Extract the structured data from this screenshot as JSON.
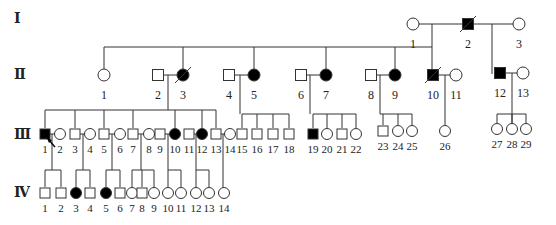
{
  "colors": {
    "line": "#333333",
    "affected": "#000000",
    "unaffected": "#ffffff"
  },
  "generations": [
    {
      "label": "Ⅰ",
      "y": 18
    },
    {
      "label": "Ⅱ",
      "y": 74
    },
    {
      "label": "Ⅲ",
      "y": 134
    },
    {
      "label": "Ⅳ",
      "y": 192
    }
  ],
  "individuals": [
    {
      "id": "I-1",
      "gen": 1,
      "num": "1",
      "sex": "F",
      "affected": false,
      "deceased": false,
      "x": 413,
      "y": 24
    },
    {
      "id": "I-2",
      "gen": 1,
      "num": "2",
      "sex": "M",
      "affected": true,
      "deceased": true,
      "x": 468,
      "y": 24
    },
    {
      "id": "I-3",
      "gen": 1,
      "num": "3",
      "sex": "F",
      "affected": false,
      "deceased": false,
      "x": 519,
      "y": 24
    },
    {
      "id": "II-1",
      "gen": 2,
      "num": "1",
      "sex": "F",
      "affected": false,
      "deceased": false,
      "x": 104,
      "y": 75
    },
    {
      "id": "II-2",
      "gen": 2,
      "num": "2",
      "sex": "M",
      "affected": false,
      "deceased": false,
      "x": 158,
      "y": 75
    },
    {
      "id": "II-3",
      "gen": 2,
      "num": "3",
      "sex": "F",
      "affected": true,
      "deceased": true,
      "x": 183,
      "y": 75
    },
    {
      "id": "II-4",
      "gen": 2,
      "num": "4",
      "sex": "M",
      "affected": false,
      "deceased": false,
      "x": 229,
      "y": 75
    },
    {
      "id": "II-5",
      "gen": 2,
      "num": "5",
      "sex": "F",
      "affected": true,
      "deceased": false,
      "x": 254,
      "y": 75
    },
    {
      "id": "II-6",
      "gen": 2,
      "num": "6",
      "sex": "M",
      "affected": false,
      "deceased": false,
      "x": 301,
      "y": 75
    },
    {
      "id": "II-7",
      "gen": 2,
      "num": "7",
      "sex": "F",
      "affected": true,
      "deceased": false,
      "x": 326,
      "y": 75
    },
    {
      "id": "II-8",
      "gen": 2,
      "num": "8",
      "sex": "M",
      "affected": false,
      "deceased": false,
      "x": 371,
      "y": 75
    },
    {
      "id": "II-9",
      "gen": 2,
      "num": "9",
      "sex": "F",
      "affected": true,
      "deceased": false,
      "x": 395,
      "y": 75
    },
    {
      "id": "II-10",
      "gen": 2,
      "num": "10",
      "sex": "M",
      "affected": true,
      "deceased": true,
      "x": 433,
      "y": 75
    },
    {
      "id": "II-11",
      "gen": 2,
      "num": "11",
      "sex": "F",
      "affected": false,
      "deceased": false,
      "x": 456,
      "y": 75
    },
    {
      "id": "II-12",
      "gen": 2,
      "num": "12",
      "sex": "M",
      "affected": true,
      "deceased": false,
      "x": 500,
      "y": 73
    },
    {
      "id": "II-13",
      "gen": 2,
      "num": "13",
      "sex": "F",
      "affected": false,
      "deceased": false,
      "x": 523,
      "y": 73
    },
    {
      "id": "III-1",
      "gen": 3,
      "num": "1",
      "sex": "M",
      "affected": true,
      "deceased": false,
      "proband": true,
      "x": 45,
      "y": 134
    },
    {
      "id": "III-2",
      "gen": 3,
      "num": "2",
      "sex": "F",
      "affected": false,
      "deceased": false,
      "x": 60,
      "y": 134
    },
    {
      "id": "III-3",
      "gen": 3,
      "num": "3",
      "sex": "M",
      "affected": false,
      "deceased": false,
      "x": 75,
      "y": 134
    },
    {
      "id": "III-4",
      "gen": 3,
      "num": "4",
      "sex": "F",
      "affected": false,
      "deceased": false,
      "x": 90,
      "y": 134
    },
    {
      "id": "III-5",
      "gen": 3,
      "num": "5",
      "sex": "M",
      "affected": false,
      "deceased": false,
      "x": 104,
      "y": 134
    },
    {
      "id": "III-6",
      "gen": 3,
      "num": "6",
      "sex": "F",
      "affected": false,
      "deceased": false,
      "x": 120,
      "y": 134
    },
    {
      "id": "III-7",
      "gen": 3,
      "num": "7",
      "sex": "M",
      "affected": false,
      "deceased": false,
      "x": 133,
      "y": 134
    },
    {
      "id": "III-8",
      "gen": 3,
      "num": "8",
      "sex": "F",
      "affected": false,
      "deceased": false,
      "x": 149,
      "y": 134
    },
    {
      "id": "III-9",
      "gen": 3,
      "num": "9",
      "sex": "M",
      "affected": false,
      "deceased": false,
      "x": 160,
      "y": 134
    },
    {
      "id": "III-10",
      "gen": 3,
      "num": "10",
      "sex": "F",
      "affected": true,
      "deceased": false,
      "x": 175,
      "y": 134
    },
    {
      "id": "III-11",
      "gen": 3,
      "num": "11",
      "sex": "M",
      "affected": false,
      "deceased": false,
      "x": 189,
      "y": 134
    },
    {
      "id": "III-12",
      "gen": 3,
      "num": "12",
      "sex": "F",
      "affected": true,
      "deceased": false,
      "x": 202,
      "y": 134
    },
    {
      "id": "III-13",
      "gen": 3,
      "num": "13",
      "sex": "M",
      "affected": false,
      "deceased": false,
      "x": 216,
      "y": 134
    },
    {
      "id": "III-14",
      "gen": 3,
      "num": "14",
      "sex": "F",
      "affected": false,
      "deceased": false,
      "x": 230,
      "y": 134
    },
    {
      "id": "III-15",
      "gen": 3,
      "num": "15",
      "sex": "M",
      "affected": false,
      "deceased": false,
      "x": 242,
      "y": 134
    },
    {
      "id": "III-16",
      "gen": 3,
      "num": "16",
      "sex": "M",
      "affected": false,
      "deceased": false,
      "x": 257,
      "y": 134
    },
    {
      "id": "III-17",
      "gen": 3,
      "num": "17",
      "sex": "M",
      "affected": false,
      "deceased": false,
      "x": 273,
      "y": 134
    },
    {
      "id": "III-18",
      "gen": 3,
      "num": "18",
      "sex": "M",
      "affected": false,
      "deceased": false,
      "x": 289,
      "y": 134
    },
    {
      "id": "III-19",
      "gen": 3,
      "num": "19",
      "sex": "M",
      "affected": true,
      "deceased": false,
      "x": 313,
      "y": 134
    },
    {
      "id": "III-20",
      "gen": 3,
      "num": "20",
      "sex": "F",
      "affected": false,
      "deceased": false,
      "x": 327,
      "y": 134
    },
    {
      "id": "III-21",
      "gen": 3,
      "num": "21",
      "sex": "M",
      "affected": false,
      "deceased": false,
      "x": 342,
      "y": 134
    },
    {
      "id": "III-22",
      "gen": 3,
      "num": "22",
      "sex": "F",
      "affected": false,
      "deceased": false,
      "x": 356,
      "y": 134
    },
    {
      "id": "III-23",
      "gen": 3,
      "num": "23",
      "sex": "M",
      "affected": false,
      "deceased": false,
      "x": 383,
      "y": 131
    },
    {
      "id": "III-24",
      "gen": 3,
      "num": "24",
      "sex": "F",
      "affected": false,
      "deceased": false,
      "x": 398,
      "y": 131
    },
    {
      "id": "III-25",
      "gen": 3,
      "num": "25",
      "sex": "F",
      "affected": false,
      "deceased": false,
      "x": 412,
      "y": 131
    },
    {
      "id": "III-26",
      "gen": 3,
      "num": "26",
      "sex": "F",
      "affected": false,
      "deceased": false,
      "x": 445,
      "y": 131
    },
    {
      "id": "III-27",
      "gen": 3,
      "num": "27",
      "sex": "F",
      "affected": false,
      "deceased": false,
      "x": 497,
      "y": 129
    },
    {
      "id": "III-28",
      "gen": 3,
      "num": "28",
      "sex": "F",
      "affected": false,
      "deceased": false,
      "x": 512,
      "y": 129
    },
    {
      "id": "III-29",
      "gen": 3,
      "num": "29",
      "sex": "F",
      "affected": false,
      "deceased": false,
      "x": 526,
      "y": 129
    },
    {
      "id": "IV-1",
      "gen": 4,
      "num": "1",
      "sex": "M",
      "affected": false,
      "deceased": false,
      "x": 45,
      "y": 193
    },
    {
      "id": "IV-2",
      "gen": 4,
      "num": "2",
      "sex": "M",
      "affected": false,
      "deceased": false,
      "x": 61,
      "y": 193
    },
    {
      "id": "IV-3",
      "gen": 4,
      "num": "3",
      "sex": "F",
      "affected": true,
      "deceased": false,
      "x": 76,
      "y": 193
    },
    {
      "id": "IV-4",
      "gen": 4,
      "num": "4",
      "sex": "M",
      "affected": false,
      "deceased": false,
      "x": 90,
      "y": 193
    },
    {
      "id": "IV-5",
      "gen": 4,
      "num": "5",
      "sex": "F",
      "affected": true,
      "deceased": false,
      "x": 106,
      "y": 193
    },
    {
      "id": "IV-6",
      "gen": 4,
      "num": "6",
      "sex": "M",
      "affected": false,
      "deceased": false,
      "x": 120,
      "y": 193
    },
    {
      "id": "IV-7",
      "gen": 4,
      "num": "7",
      "sex": "F",
      "affected": false,
      "deceased": false,
      "x": 132,
      "y": 193
    },
    {
      "id": "IV-8",
      "gen": 4,
      "num": "8",
      "sex": "M",
      "affected": false,
      "deceased": false,
      "x": 142,
      "y": 193
    },
    {
      "id": "IV-9",
      "gen": 4,
      "num": "9",
      "sex": "F",
      "affected": false,
      "deceased": false,
      "x": 154,
      "y": 193
    },
    {
      "id": "IV-10",
      "gen": 4,
      "num": "10",
      "sex": "F",
      "affected": false,
      "deceased": false,
      "x": 168,
      "y": 193
    },
    {
      "id": "IV-11",
      "gen": 4,
      "num": "11",
      "sex": "F",
      "affected": false,
      "deceased": false,
      "x": 181,
      "y": 193
    },
    {
      "id": "IV-12",
      "gen": 4,
      "num": "12",
      "sex": "F",
      "affected": false,
      "deceased": false,
      "x": 196,
      "y": 193
    },
    {
      "id": "IV-13",
      "gen": 4,
      "num": "13",
      "sex": "F",
      "affected": false,
      "deceased": false,
      "x": 209,
      "y": 193
    },
    {
      "id": "IV-14",
      "gen": 4,
      "num": "14",
      "sex": "F",
      "affected": false,
      "deceased": false,
      "x": 224,
      "y": 193
    }
  ],
  "lines": [
    [
      413,
      24,
      519,
      24
    ],
    [
      432,
      24,
      432,
      47
    ],
    [
      492,
      24,
      492,
      74
    ],
    [
      104,
      47,
      432,
      47
    ],
    [
      104,
      47,
      104,
      69
    ],
    [
      183,
      47,
      183,
      69
    ],
    [
      254,
      47,
      254,
      69
    ],
    [
      326,
      47,
      326,
      69
    ],
    [
      395,
      47,
      395,
      69
    ],
    [
      432,
      47,
      432,
      69
    ],
    [
      158,
      75,
      183,
      75
    ],
    [
      168,
      75,
      168,
      110
    ],
    [
      229,
      75,
      254,
      75
    ],
    [
      240,
      75,
      240,
      114
    ],
    [
      301,
      75,
      326,
      75
    ],
    [
      310,
      75,
      310,
      114
    ],
    [
      371,
      75,
      395,
      75
    ],
    [
      380,
      75,
      380,
      114
    ],
    [
      433,
      75,
      456,
      75
    ],
    [
      445,
      75,
      445,
      125
    ],
    [
      500,
      73,
      523,
      73
    ],
    [
      512,
      73,
      512,
      123
    ],
    [
      45,
      110,
      216,
      110
    ],
    [
      45,
      110,
      45,
      128
    ],
    [
      75,
      110,
      75,
      128
    ],
    [
      104,
      110,
      104,
      128
    ],
    [
      133,
      110,
      133,
      128
    ],
    [
      175,
      110,
      175,
      128
    ],
    [
      202,
      110,
      202,
      128
    ],
    [
      216,
      110,
      216,
      128
    ],
    [
      242,
      114,
      289,
      114
    ],
    [
      242,
      114,
      242,
      128
    ],
    [
      257,
      114,
      257,
      128
    ],
    [
      273,
      114,
      273,
      128
    ],
    [
      289,
      114,
      289,
      128
    ],
    [
      313,
      114,
      356,
      114
    ],
    [
      313,
      114,
      313,
      128
    ],
    [
      327,
      114,
      327,
      128
    ],
    [
      342,
      114,
      342,
      128
    ],
    [
      356,
      114,
      356,
      128
    ],
    [
      380,
      114,
      412,
      114
    ],
    [
      383,
      114,
      383,
      125
    ],
    [
      398,
      114,
      398,
      125
    ],
    [
      412,
      114,
      412,
      125
    ],
    [
      497,
      114,
      526,
      114
    ],
    [
      497,
      114,
      497,
      123
    ],
    [
      512,
      114,
      512,
      123
    ],
    [
      526,
      114,
      526,
      123
    ],
    [
      45,
      134,
      60,
      134
    ],
    [
      52,
      134,
      52,
      170
    ],
    [
      75,
      134,
      90,
      134
    ],
    [
      83,
      134,
      83,
      170
    ],
    [
      104,
      134,
      120,
      134
    ],
    [
      112,
      134,
      112,
      170
    ],
    [
      133,
      134,
      149,
      134
    ],
    [
      141,
      134,
      141,
      170
    ],
    [
      160,
      134,
      175,
      134
    ],
    [
      168,
      134,
      168,
      170
    ],
    [
      189,
      134,
      202,
      134
    ],
    [
      196,
      134,
      196,
      170
    ],
    [
      216,
      134,
      230,
      134
    ],
    [
      223,
      134,
      223,
      187
    ],
    [
      45,
      170,
      61,
      170
    ],
    [
      45,
      170,
      45,
      187
    ],
    [
      61,
      170,
      61,
      187
    ],
    [
      76,
      170,
      90,
      170
    ],
    [
      76,
      170,
      76,
      187
    ],
    [
      90,
      170,
      90,
      187
    ],
    [
      106,
      170,
      120,
      170
    ],
    [
      106,
      170,
      106,
      187
    ],
    [
      120,
      170,
      120,
      187
    ],
    [
      132,
      170,
      154,
      170
    ],
    [
      132,
      170,
      132,
      187
    ],
    [
      142,
      170,
      142,
      187
    ],
    [
      154,
      170,
      154,
      187
    ],
    [
      168,
      170,
      181,
      170
    ],
    [
      168,
      170,
      168,
      187
    ],
    [
      181,
      170,
      181,
      187
    ],
    [
      196,
      170,
      209,
      170
    ],
    [
      196,
      170,
      196,
      187
    ],
    [
      209,
      170,
      209,
      187
    ]
  ]
}
